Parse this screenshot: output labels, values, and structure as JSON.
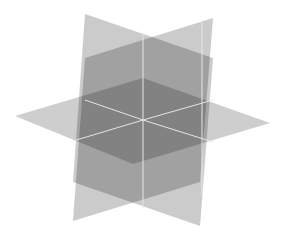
{
  "diagram": {
    "background": "#ffffff",
    "planes": [
      {
        "name": "vertical-plane-a",
        "points": "85,14 213,58 200,226 73,182",
        "fill": "#b9b9b9",
        "opacity": "0.75"
      },
      {
        "name": "vertical-plane-b",
        "points": "213,18 85,58 73,221 200,182",
        "fill": "#b9b9b9",
        "opacity": "0.75"
      },
      {
        "name": "horizontal-plane",
        "points": "15,116 143,78 270,123 133,164",
        "fill": "#bdbdbd",
        "opacity": "0.75"
      }
    ],
    "intersection_lines": [
      {
        "name": "vertical-axis-line",
        "x1": "143",
        "y1": "33",
        "x2": "143",
        "y2": "208"
      },
      {
        "name": "right-edge-line",
        "x1": "202",
        "y1": "20",
        "x2": "202",
        "y2": "196"
      },
      {
        "name": "horizontal-line-left",
        "x1": "73",
        "y1": "141",
        "x2": "143",
        "y2": "120"
      },
      {
        "name": "horizontal-line-right",
        "x1": "143",
        "y1": "120",
        "x2": "213",
        "y2": "142"
      },
      {
        "name": "horizontal-line-back-right",
        "x1": "143",
        "y1": "120",
        "x2": "213",
        "y2": "100"
      },
      {
        "name": "horizontal-line-back-left",
        "x1": "85",
        "y1": "100",
        "x2": "143",
        "y2": "120"
      }
    ],
    "line_color": "#e6e6e6"
  }
}
